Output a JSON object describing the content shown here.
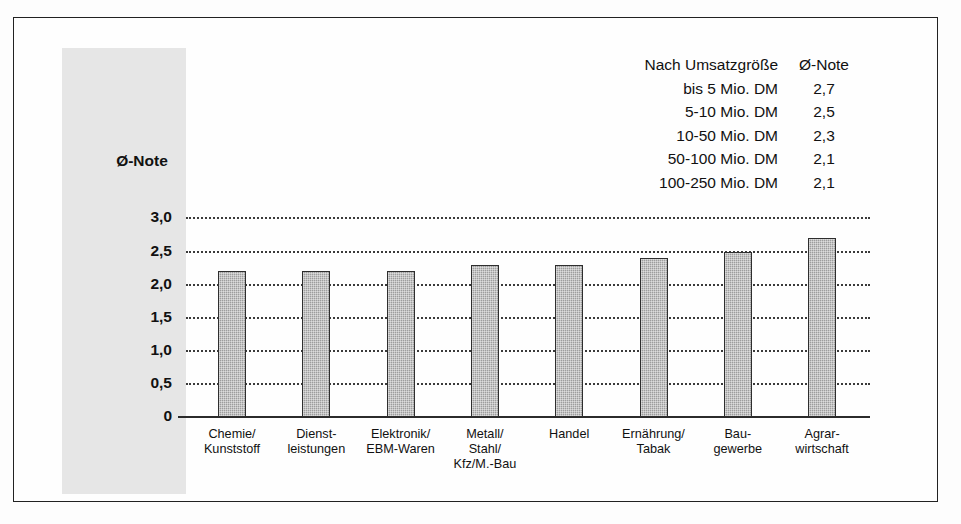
{
  "chart_data": {
    "type": "bar",
    "title": "",
    "subtitle": "",
    "xlabel": "",
    "ylabel": "Ø-Note",
    "ylim": [
      0,
      3.0
    ],
    "grid": true,
    "legend_position": "top-right",
    "categories": [
      "Chemie/\nKunststoff",
      "Dienst-\nleistungen",
      "Elektronik/\nEBM-Waren",
      "Metall/\nStahl/\nKfz/M.-Bau",
      "Handel",
      "Ernährung/\nTabak",
      "Bau-\ngewerbe",
      "Agrar-\nwirtschaft"
    ],
    "values": [
      2.2,
      2.2,
      2.2,
      2.3,
      2.3,
      2.4,
      2.5,
      2.7
    ],
    "ytick_labels": [
      "0",
      "0,5",
      "1,0",
      "1,5",
      "2,0",
      "2,5",
      "3,0"
    ],
    "ytick_values": [
      0,
      0.5,
      1.0,
      1.5,
      2.0,
      2.5,
      3.0
    ],
    "annotations": {
      "table_title": "Nach Umsatzgröße",
      "table_value_header": "Ø-Note",
      "table_rows": [
        {
          "label": "bis 5 Mio. DM",
          "value": "2,7"
        },
        {
          "label": "5-10 Mio. DM",
          "value": "2,5"
        },
        {
          "label": "10-50 Mio. DM",
          "value": "2,3"
        },
        {
          "label": "50-100 Mio. DM",
          "value": "2,1"
        },
        {
          "label": "100-250 Mio. DM",
          "value": "2,1"
        }
      ]
    },
    "colors": {
      "bar_fill": "#9d9d9d",
      "bar_stroke": "#2e2e2e",
      "grid": "#3a3a3a",
      "axis": "#2b2b2b",
      "panel": "#e6e6e6",
      "frame": "#222222",
      "text": "#111111"
    }
  },
  "axis": {
    "title": "Ø-Note",
    "ticks": [
      {
        "label": "3,0"
      },
      {
        "label": "2,5"
      },
      {
        "label": "2,0"
      },
      {
        "label": "1,5"
      },
      {
        "label": "1,0"
      },
      {
        "label": "0,5"
      },
      {
        "label": "0"
      }
    ]
  },
  "categories": [
    {
      "lines": [
        "Chemie/",
        "Kunststoff"
      ]
    },
    {
      "lines": [
        "Dienst-",
        "leistungen"
      ]
    },
    {
      "lines": [
        "Elektronik/",
        "EBM-Waren"
      ]
    },
    {
      "lines": [
        "Metall/",
        "Stahl/",
        "Kfz/M.-Bau"
      ]
    },
    {
      "lines": [
        "Handel"
      ]
    },
    {
      "lines": [
        "Ernährung/",
        "Tabak"
      ]
    },
    {
      "lines": [
        "Bau-",
        "gewerbe"
      ]
    },
    {
      "lines": [
        "Agrar-",
        "wirtschaft"
      ]
    }
  ],
  "legend": {
    "header_label": "Nach Umsatzgröße",
    "header_value": "Ø-Note",
    "rows": [
      {
        "label": "bis 5 Mio. DM",
        "value": "2,7"
      },
      {
        "label": "5-10 Mio. DM",
        "value": "2,5"
      },
      {
        "label": "10-50 Mio. DM",
        "value": "2,3"
      },
      {
        "label": "50-100 Mio. DM",
        "value": "2,1"
      },
      {
        "label": "100-250 Mio. DM",
        "value": "2,1"
      }
    ]
  }
}
